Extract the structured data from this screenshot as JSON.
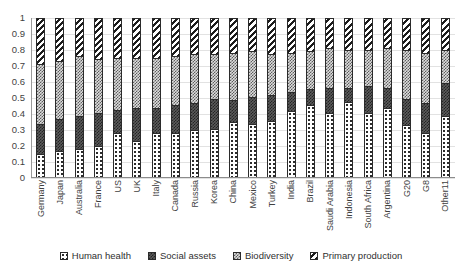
{
  "chart_data": {
    "type": "bar",
    "subtype": "stacked-100-percent",
    "title": "",
    "xlabel": "",
    "ylabel": "",
    "ylim": [
      0,
      1
    ],
    "yticks": [
      "0",
      "0.1",
      "0.2",
      "0.3",
      "0.4",
      "0.5",
      "0.6",
      "0.7",
      "0.8",
      "0.9",
      "1"
    ],
    "grid": true,
    "grid_axis": "y",
    "legend_position": "bottom",
    "categories": [
      "Germany",
      "Japan",
      "Australia",
      "France",
      "US",
      "UK",
      "Italy",
      "Canada",
      "Russia",
      "Korea",
      "China",
      "Mexico",
      "Turkey",
      "India",
      "Brazil",
      "Saudi Arabia",
      "Indonesia",
      "South Africa",
      "Argentina",
      "G20",
      "G8",
      "Other11"
    ],
    "series": [
      {
        "name": "Human health",
        "pattern": "dotted-circles",
        "values": [
          0.14,
          0.16,
          0.17,
          0.19,
          0.27,
          0.22,
          0.27,
          0.27,
          0.29,
          0.3,
          0.34,
          0.33,
          0.35,
          0.41,
          0.45,
          0.4,
          0.47,
          0.4,
          0.43,
          0.32,
          0.27,
          0.38
        ]
      },
      {
        "name": "Social assets",
        "pattern": "dark-checker",
        "values": [
          0.19,
          0.2,
          0.21,
          0.21,
          0.15,
          0.21,
          0.16,
          0.18,
          0.17,
          0.19,
          0.14,
          0.17,
          0.16,
          0.12,
          0.1,
          0.16,
          0.09,
          0.17,
          0.13,
          0.17,
          0.19,
          0.21
        ]
      },
      {
        "name": "Biodiversity",
        "pattern": "light-checker",
        "values": [
          0.38,
          0.37,
          0.38,
          0.34,
          0.33,
          0.32,
          0.32,
          0.31,
          0.31,
          0.28,
          0.3,
          0.29,
          0.26,
          0.25,
          0.24,
          0.25,
          0.24,
          0.23,
          0.25,
          0.31,
          0.32,
          0.21
        ]
      },
      {
        "name": "Primary production",
        "pattern": "diagonal-stripes",
        "values": [
          0.29,
          0.27,
          0.24,
          0.26,
          0.25,
          0.25,
          0.25,
          0.24,
          0.23,
          0.23,
          0.22,
          0.21,
          0.23,
          0.22,
          0.21,
          0.19,
          0.2,
          0.2,
          0.19,
          0.2,
          0.22,
          0.2
        ]
      }
    ]
  },
  "legend": {
    "items": [
      {
        "label": "Human health"
      },
      {
        "label": "Social assets"
      },
      {
        "label": "Biodiversity"
      },
      {
        "label": "Primary production"
      }
    ]
  }
}
